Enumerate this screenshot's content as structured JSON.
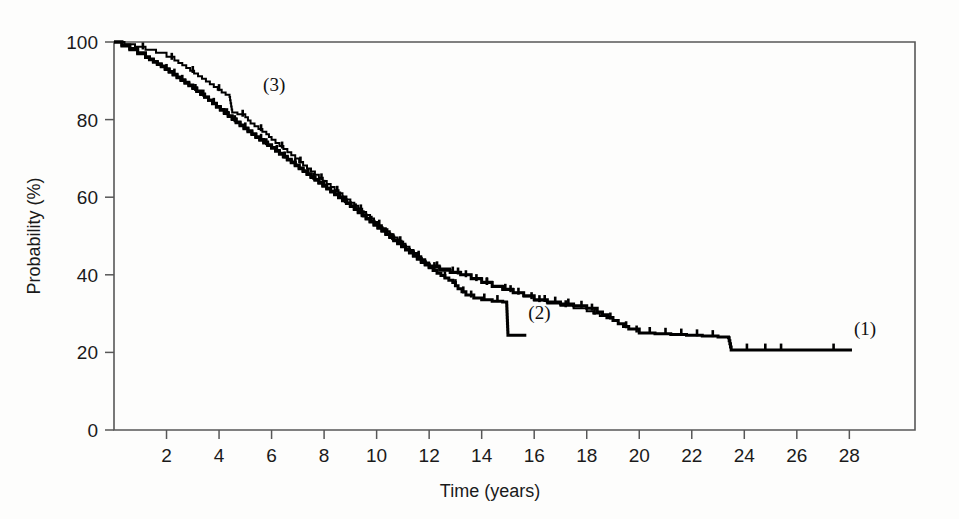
{
  "chart_data": {
    "type": "line",
    "title": "",
    "subtitle": "",
    "xlabel": "Time (years)",
    "ylabel": "Probability (%)",
    "xlim": [
      0,
      30.5
    ],
    "ylim": [
      0,
      100
    ],
    "grid": false,
    "legend_position": "inline-curve-labels",
    "x_ticks": [
      2,
      4,
      6,
      8,
      10,
      12,
      14,
      16,
      18,
      20,
      22,
      24,
      26,
      28
    ],
    "y_ticks": [
      0,
      20,
      40,
      60,
      80,
      100
    ],
    "annotations": [
      {
        "text": "(1)",
        "x": 28.6,
        "y": 24.5
      },
      {
        "text": "(2)",
        "x": 16.2,
        "y": 28.5
      },
      {
        "text": "(3)",
        "x": 6.1,
        "y": 87.5
      }
    ],
    "series": [
      {
        "name": "(1)",
        "label": "(1)",
        "x": [
          0,
          0.3,
          0.6,
          0.9,
          1.2,
          1.5,
          1.8,
          2.1,
          2.4,
          2.7,
          3.0,
          3.3,
          3.6,
          3.9,
          4.2,
          4.5,
          4.8,
          5.1,
          5.4,
          5.7,
          6.0,
          6.3,
          6.6,
          6.9,
          7.2,
          7.5,
          7.8,
          8.1,
          8.4,
          8.7,
          9.0,
          9.3,
          9.6,
          9.9,
          10.2,
          10.5,
          10.8,
          11.1,
          11.4,
          11.7,
          12.0,
          12.4,
          12.8,
          13.2,
          13.6,
          14.0,
          14.4,
          14.8,
          15.2,
          15.6,
          16.0,
          16.5,
          17.0,
          17.5,
          18.0,
          18.4,
          18.8,
          19.2,
          19.6,
          20.0,
          20.6,
          21.2,
          21.8,
          22.4,
          23.0,
          23.4,
          23.5,
          24.2,
          25.0,
          26.0,
          27.0,
          28.1
        ],
        "y": [
          100,
          99.0,
          98.0,
          97.0,
          96.0,
          94.8,
          93.6,
          92.2,
          90.8,
          89.4,
          88.0,
          86.5,
          85.0,
          83.4,
          81.8,
          80.2,
          78.6,
          77.1,
          75.6,
          74.2,
          72.8,
          71.3,
          69.8,
          68.3,
          66.8,
          65.3,
          63.8,
          62.3,
          60.8,
          59.3,
          57.8,
          56.2,
          54.6,
          53.0,
          51.4,
          49.8,
          48.2,
          46.6,
          45.0,
          43.5,
          42.0,
          41.2,
          40.6,
          40.0,
          39.0,
          38.0,
          37.0,
          36.2,
          35.4,
          34.6,
          33.6,
          33.0,
          32.5,
          32.0,
          31.4,
          30.4,
          29.0,
          27.4,
          26.0,
          25.0,
          24.8,
          24.6,
          24.4,
          24.2,
          24.0,
          23.8,
          20.6,
          20.6,
          20.6,
          20.6,
          20.6,
          20.6
        ],
        "censor_times": [
          2.0,
          2.6,
          3.1,
          3.8,
          4.3,
          5.0,
          5.6,
          6.2,
          6.9,
          7.4,
          8.0,
          8.6,
          9.2,
          9.8,
          10.4,
          11.0,
          11.6,
          12.2,
          12.9,
          13.4,
          13.8,
          14.2,
          14.9,
          15.4,
          15.9,
          16.4,
          16.8,
          17.3,
          17.8,
          18.2,
          18.9,
          19.5,
          19.9,
          20.4,
          21.0,
          21.6,
          22.2,
          22.8,
          24.1,
          24.8,
          25.4,
          27.4
        ],
        "end_probability": 20.6
      },
      {
        "name": "(2)",
        "label": "(2)",
        "x": [
          0,
          0.3,
          0.6,
          0.9,
          1.2,
          1.5,
          1.8,
          2.1,
          2.4,
          2.7,
          3.0,
          3.3,
          3.6,
          3.9,
          4.2,
          4.5,
          4.8,
          5.1,
          5.4,
          5.7,
          6.0,
          6.3,
          6.6,
          6.9,
          7.2,
          7.5,
          7.8,
          8.1,
          8.4,
          8.7,
          9.0,
          9.3,
          9.6,
          9.9,
          10.2,
          10.5,
          10.8,
          11.1,
          11.4,
          11.7,
          12.0,
          12.3,
          12.6,
          12.9,
          13.1,
          13.4,
          13.7,
          14.0,
          14.4,
          14.8,
          14.95,
          15.0,
          15.7
        ],
        "y": [
          100,
          99.2,
          98.3,
          97.2,
          96.2,
          95.0,
          93.8,
          92.4,
          91.0,
          89.6,
          88.2,
          86.6,
          85.0,
          83.2,
          81.6,
          80.0,
          78.4,
          76.9,
          75.4,
          74.0,
          72.6,
          71.1,
          69.6,
          68.1,
          66.6,
          65.1,
          63.6,
          62.1,
          60.6,
          59.1,
          57.6,
          56.0,
          54.4,
          52.8,
          51.2,
          49.6,
          48.0,
          46.4,
          44.8,
          43.2,
          41.8,
          40.4,
          39.2,
          38.0,
          36.4,
          34.8,
          34.0,
          33.6,
          33.2,
          33.0,
          32.8,
          24.4,
          24.4
        ],
        "censor_times": [
          2.3,
          3.4,
          4.6,
          5.8,
          6.5,
          7.6,
          8.8,
          9.5,
          10.6,
          11.4,
          12.6,
          13.0,
          13.3,
          13.6,
          14.1,
          14.6
        ],
        "end_probability": 24.4
      },
      {
        "name": "(3)",
        "label": "(3)",
        "x": [
          0,
          0.4,
          0.8,
          1.2,
          1.6,
          2.0,
          2.3,
          2.6,
          2.9,
          3.2,
          3.5,
          3.8,
          4.1,
          4.4,
          4.5,
          4.7,
          5.0,
          5.2,
          5.5,
          5.8,
          6.0,
          6.3,
          6.6,
          6.9,
          7.2,
          7.5,
          7.8,
          8.1,
          8.4,
          8.7,
          9.0,
          9.3,
          9.6,
          9.9,
          10.2,
          10.5,
          10.8,
          11.1,
          11.4,
          11.7,
          12.0,
          12.4,
          12.8,
          13.2,
          13.6,
          14.0,
          14.4,
          14.8,
          15.2,
          15.6,
          16.0,
          16.5,
          17.0,
          17.5,
          18.0,
          18.5,
          19.0
        ],
        "y": [
          100,
          99.4,
          98.8,
          98.0,
          97.2,
          96.2,
          95.2,
          94.0,
          92.6,
          91.2,
          89.8,
          88.4,
          87.0,
          85.8,
          81.8,
          81.4,
          80.6,
          79.0,
          77.6,
          76.2,
          74.8,
          73.2,
          71.6,
          70.0,
          68.2,
          66.6,
          65.0,
          63.4,
          61.8,
          60.2,
          58.6,
          57.0,
          55.4,
          53.6,
          52.0,
          50.4,
          48.8,
          47.2,
          45.6,
          44.0,
          42.4,
          41.6,
          40.8,
          40.0,
          39.2,
          38.2,
          37.2,
          36.4,
          35.4,
          34.4,
          33.4,
          32.6,
          32.0,
          31.4,
          30.6,
          29.4,
          28.2
        ],
        "censor_times": [
          1.1,
          2.2,
          3.0,
          4.0,
          4.9,
          5.6,
          6.4,
          7.1,
          7.9,
          8.5,
          9.4,
          10.1,
          10.9,
          11.6,
          12.3,
          13.1,
          14.2,
          15.1,
          16.2,
          17.2,
          18.3
        ],
        "end_probability": 28.2
      }
    ]
  },
  "axes": {
    "x_tick_labels": [
      "2",
      "4",
      "6",
      "8",
      "10",
      "12",
      "14",
      "16",
      "18",
      "20",
      "22",
      "24",
      "26",
      "28"
    ],
    "y_tick_labels": [
      "0",
      "20",
      "40",
      "60",
      "80",
      "100"
    ],
    "x_axis_title": "Time (years)",
    "y_axis_title": "Probability (%)"
  },
  "curve_labels": {
    "one": "(1)",
    "two": "(2)",
    "three": "(3)"
  },
  "colors": {
    "curve": "#000000",
    "frame": "#575757",
    "text": "#1a1a1a",
    "background": "#fdfdfc"
  }
}
